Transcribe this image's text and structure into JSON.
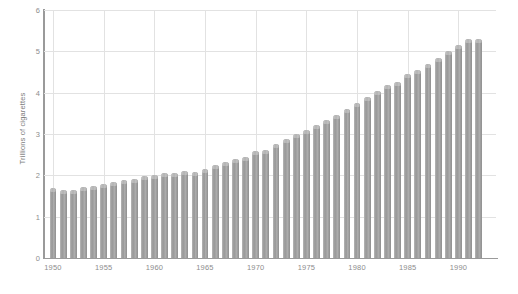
{
  "chart_data": {
    "type": "bar",
    "title": "",
    "subtitle": "",
    "xlabel": "",
    "ylabel": "Trillions of cigarettes",
    "ylim": [
      0,
      6
    ],
    "ytick_labels": [
      "0",
      "1",
      "2",
      "3",
      "4",
      "5",
      "6"
    ],
    "yticks": [
      0,
      1,
      2,
      3,
      4,
      5,
      6
    ],
    "xtick_labels": [
      "1950",
      "1955",
      "1960",
      "1965",
      "1970",
      "1975",
      "1980",
      "1985",
      "1990"
    ],
    "xticks": [
      1950,
      1955,
      1960,
      1965,
      1970,
      1975,
      1980,
      1985,
      1990
    ],
    "grid": true,
    "legend": null,
    "categories": [
      "1950",
      "1951",
      "1952",
      "1953",
      "1954",
      "1955",
      "1956",
      "1957",
      "1958",
      "1959",
      "1960",
      "1961",
      "1962",
      "1963",
      "1964",
      "1965",
      "1966",
      "1967",
      "1968",
      "1969",
      "1970",
      "1971",
      "1972",
      "1973",
      "1974",
      "1975",
      "1976",
      "1977",
      "1978",
      "1979",
      "1980",
      "1981",
      "1982",
      "1983",
      "1984",
      "1985",
      "1986",
      "1987",
      "1988",
      "1989",
      "1990",
      "1991",
      "1992"
    ],
    "values": [
      1.69,
      1.65,
      1.65,
      1.72,
      1.75,
      1.78,
      1.83,
      1.9,
      1.92,
      1.98,
      2.02,
      2.05,
      2.05,
      2.1,
      2.08,
      2.16,
      2.25,
      2.32,
      2.4,
      2.45,
      2.6,
      2.62,
      2.75,
      2.88,
      3.0,
      3.1,
      3.22,
      3.35,
      3.45,
      3.6,
      3.75,
      3.9,
      4.05,
      4.18,
      4.25,
      4.45,
      4.55,
      4.7,
      4.85,
      5.0,
      5.15,
      5.3,
      5.3
    ],
    "bar_color": "#a3a3a3",
    "grid_color": "#e2e2e2",
    "axis_color": "#9a9a9a",
    "text_color": "#8d8d8d",
    "background": "#ffffff"
  }
}
